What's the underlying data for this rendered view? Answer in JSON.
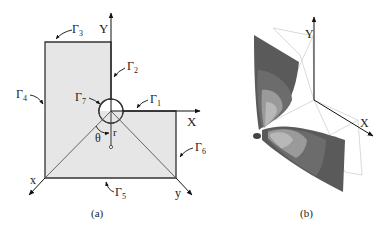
{
  "panel_a": {
    "caption": "(a)",
    "axis_labels": {
      "Y": "Y",
      "X": "X",
      "x": "x",
      "y": "y"
    },
    "boundaries": [
      {
        "id": "G1",
        "base": "Γ",
        "sub": "1"
      },
      {
        "id": "G2",
        "base": "Γ",
        "sub": "2"
      },
      {
        "id": "G3",
        "base": "Γ",
        "sub": "3"
      },
      {
        "id": "G4",
        "base": "Γ",
        "sub": "4"
      },
      {
        "id": "G5",
        "base": "Γ",
        "sub": "5"
      },
      {
        "id": "G6",
        "base": "Γ",
        "sub": "6"
      },
      {
        "id": "G7",
        "base": "Γ",
        "sub": "7"
      }
    ],
    "polar": {
      "theta": "θ",
      "r": "r"
    },
    "colors": {
      "fill": "#e6e6e6",
      "stroke": "#333333"
    }
  },
  "panel_b": {
    "caption": "(b)",
    "axis_labels": {
      "Y": "Y",
      "X": "X"
    },
    "colors": {
      "dark": "#555555",
      "mid": "#7a7a7a",
      "light": "#a8a8a8",
      "lighter": "#c8c8c8",
      "wire": "#d0d0d0"
    }
  }
}
